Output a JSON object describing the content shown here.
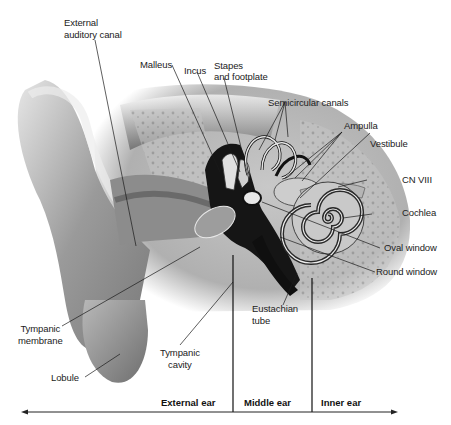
{
  "diagram": {
    "labels": {
      "external_auditory_canal": "External\nauditory canal",
      "malleus": "Malleus",
      "incus": "Incus",
      "stapes": "Stapes\nand footplate",
      "semicircular_canals": "Semicircular canals",
      "ampulla": "Ampulla",
      "vestibule": "Vestibule",
      "cn_viii": "CN VIII",
      "cochlea": "Cochlea",
      "oval_window": "Oval window",
      "round_window": "Round window",
      "eustachian_tube": "Eustachian\ntube",
      "tympanic_membrane": "Tympanic\nmembrane",
      "tympanic_cavity": "Tympanic\ncavity",
      "lobule": "Lobule"
    },
    "regions": {
      "external": "External ear",
      "middle": "Middle ear",
      "inner": "Inner ear"
    },
    "colors": {
      "background": "#ffffff",
      "line": "#1a1a1a",
      "tissue_light": "#d9d9d9",
      "tissue_mid": "#a8a8a8",
      "tissue_dark": "#555555",
      "cavity": "#111111"
    }
  }
}
